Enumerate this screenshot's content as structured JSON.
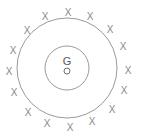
{
  "diagram": {
    "type": "concentric-circles-field",
    "colors": {
      "background": "#ffffff",
      "stroke": "#9a9a9a",
      "cross": "#8a8a8a",
      "label": "#555555"
    },
    "center": {
      "x": 67,
      "y": 68
    },
    "outer_circle": {
      "r": 50
    },
    "inner_circle": {
      "r": 22
    },
    "center_label": "G",
    "center_point_label": "O",
    "field_marker": "X",
    "field_markers": [
      {
        "x": 68,
        "y": 12
      },
      {
        "x": 45,
        "y": 16
      },
      {
        "x": 90,
        "y": 16
      },
      {
        "x": 27,
        "y": 30
      },
      {
        "x": 110,
        "y": 29
      },
      {
        "x": 13,
        "y": 50
      },
      {
        "x": 123,
        "y": 46
      },
      {
        "x": 9,
        "y": 71
      },
      {
        "x": 128,
        "y": 70
      },
      {
        "x": 14,
        "y": 92
      },
      {
        "x": 124,
        "y": 90
      },
      {
        "x": 28,
        "y": 112
      },
      {
        "x": 112,
        "y": 109
      },
      {
        "x": 47,
        "y": 123
      },
      {
        "x": 70,
        "y": 127
      },
      {
        "x": 92,
        "y": 121
      }
    ]
  }
}
